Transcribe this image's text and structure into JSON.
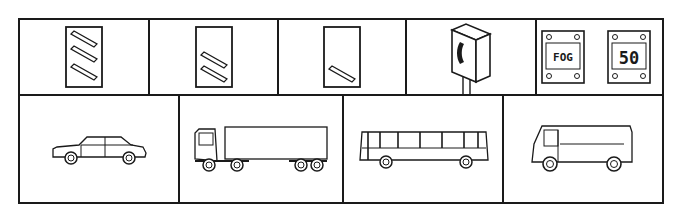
{
  "top_row": [
    {
      "name": "countdown-marker-3-bars",
      "bars": 3
    },
    {
      "name": "countdown-marker-2-bars",
      "bars": 2
    },
    {
      "name": "countdown-marker-1-bar",
      "bars": 1
    },
    {
      "name": "emergency-telephone",
      "label": ""
    },
    {
      "name": "fog-speed-signs",
      "signs": [
        {
          "text": "FOG"
        },
        {
          "text": "50"
        }
      ]
    }
  ],
  "bottom_row": [
    {
      "name": "car"
    },
    {
      "name": "articulated-lorry"
    },
    {
      "name": "bus"
    },
    {
      "name": "van"
    }
  ],
  "colors": {
    "stroke": "#1a1a1a",
    "background": "#ffffff"
  }
}
